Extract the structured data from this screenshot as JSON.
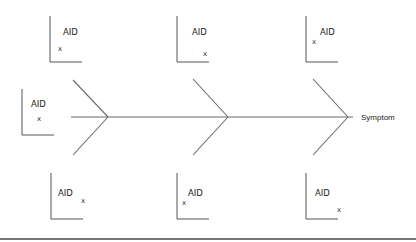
{
  "diagram": {
    "type": "fishbone",
    "effect_label": "Symptom",
    "colors": {
      "line": "#6b6b6b",
      "text": "#222222",
      "rule": "#4a4a4a"
    },
    "spine": {
      "x1": 71,
      "y1": 117,
      "x2": 353,
      "y2": 117
    },
    "bones": [
      {
        "vertex": [
          108,
          117
        ],
        "top": [
          73,
          80
        ],
        "bottom": [
          73,
          155
        ]
      },
      {
        "vertex": [
          228,
          117
        ],
        "top": [
          193,
          79
        ],
        "bottom": [
          193,
          155
        ]
      },
      {
        "vertex": [
          348,
          117
        ],
        "top": [
          313,
          79
        ],
        "bottom": [
          313,
          155
        ]
      }
    ],
    "cause_plots": [
      {
        "id": "top-1",
        "label": "AID",
        "marker": "x",
        "origin": [
          50,
          62
        ],
        "label_pos": [
          63,
          35
        ],
        "marker_pos": [
          58,
          51
        ]
      },
      {
        "id": "top-2",
        "label": "AID",
        "marker": "x",
        "origin": [
          177,
          62
        ],
        "label_pos": [
          192,
          35
        ],
        "marker_pos": [
          203,
          56
        ]
      },
      {
        "id": "top-3",
        "label": "AID",
        "marker": "x",
        "origin": [
          306,
          62
        ],
        "label_pos": [
          320,
          35
        ],
        "marker_pos": [
          312,
          44
        ]
      },
      {
        "id": "mid-left",
        "label": "AID",
        "marker": "x",
        "origin": [
          22,
          135
        ],
        "label_pos": [
          31,
          107
        ],
        "marker_pos": [
          37,
          121
        ]
      },
      {
        "id": "bot-1",
        "label": "AID",
        "marker": "x",
        "origin": [
          51,
          219
        ],
        "label_pos": [
          58,
          196
        ],
        "marker_pos": [
          81,
          203
        ]
      },
      {
        "id": "bot-2",
        "label": "AID",
        "marker": "x",
        "origin": [
          177,
          219
        ],
        "label_pos": [
          188,
          196
        ],
        "marker_pos": [
          182,
          205
        ]
      },
      {
        "id": "bot-3",
        "label": "AID",
        "marker": "x",
        "origin": [
          306,
          219
        ],
        "label_pos": [
          315,
          196
        ],
        "marker_pos": [
          337,
          212
        ]
      }
    ],
    "bottom_rule": {
      "y": 239
    }
  }
}
